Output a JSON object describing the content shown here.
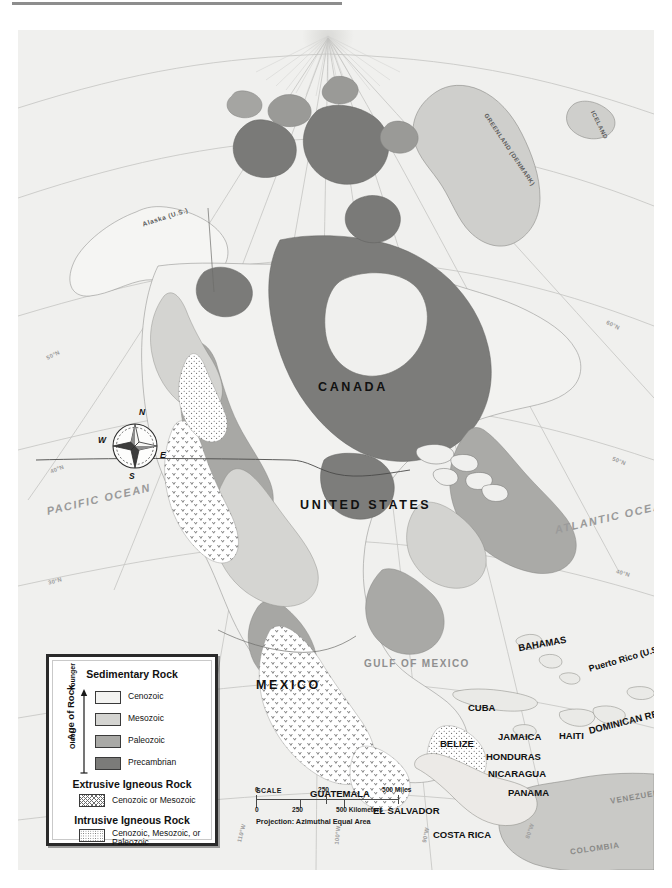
{
  "map": {
    "title": "Geologic Map of North America",
    "projection_note": "Projection: Azimuthal Equal Area",
    "background_color": "#f0f0ee",
    "countries": [
      {
        "name": "CANADA",
        "x": 318,
        "y": 356,
        "style": "big"
      },
      {
        "name": "UNITED STATES",
        "x": 300,
        "y": 474,
        "style": "big"
      },
      {
        "name": "MEXICO",
        "x": 255,
        "y": 655,
        "style": "big"
      },
      {
        "name": "BELIZE",
        "x": 440,
        "y": 714,
        "style": "sm"
      },
      {
        "name": "GUATEMALA",
        "x": 310,
        "y": 766,
        "style": "sm"
      },
      {
        "name": "EL SALVADOR",
        "x": 375,
        "y": 782,
        "style": "sm"
      },
      {
        "name": "HONDURAS",
        "x": 493,
        "y": 727,
        "style": "sm"
      },
      {
        "name": "NICARAGUA",
        "x": 497,
        "y": 744,
        "style": "sm"
      },
      {
        "name": "COSTA RICA",
        "x": 437,
        "y": 811,
        "style": "sm2"
      },
      {
        "name": "PANAMA",
        "x": 510,
        "y": 763,
        "style": "sm"
      },
      {
        "name": "CUBA",
        "x": 466,
        "y": 678,
        "style": "sm"
      },
      {
        "name": "JAMAICA",
        "x": 506,
        "y": 707,
        "style": "sm"
      },
      {
        "name": "HAITI",
        "x": 557,
        "y": 706,
        "style": "sm"
      },
      {
        "name": "BAHAMAS",
        "x": 524,
        "y": 616,
        "style": "sm"
      },
      {
        "name": "DOMINICAN REPUBLIC",
        "x": 588,
        "y": 697,
        "style": "sm"
      },
      {
        "name": "Puerto Rico (U.S.)",
        "x": 590,
        "y": 637,
        "style": "sm"
      }
    ],
    "regions": [
      {
        "name": "Alaska (U.S.)",
        "x": 139,
        "y": 192,
        "style": "isl"
      },
      {
        "name": "GREENLAND (DENMARK)",
        "x": 475,
        "y": 120,
        "style": "isl"
      },
      {
        "name": "ICELAND",
        "x": 582,
        "y": 101,
        "style": "isl"
      },
      {
        "name": "VENEZUELA",
        "x": 615,
        "y": 768,
        "style": "xs"
      },
      {
        "name": "COLOMBIA",
        "x": 575,
        "y": 819,
        "style": "xs"
      }
    ],
    "water_bodies": [
      {
        "name": "PACIFIC OCEAN",
        "x": 38,
        "y": 474,
        "style": "ocean"
      },
      {
        "name": "ATLANTIC OCEAN",
        "x": 556,
        "y": 494,
        "style": "ocean"
      },
      {
        "name": "GULF OF MEXICO",
        "x": 372,
        "y": 635,
        "style": "gulf"
      }
    ],
    "graticule": {
      "latitude_labels": [
        "50°N",
        "40°N",
        "30°N",
        "20°N",
        "10°N",
        "60°N"
      ],
      "longitude_labels": [
        "110°W",
        "100°W",
        "90°W",
        "80°W",
        "120°W",
        "70°W"
      ]
    }
  },
  "legend": {
    "sections": [
      {
        "heading": "Sedimentary Rock",
        "axis_label": "Age of Rock",
        "axis_top": "Younger",
        "axis_bottom": "Older",
        "items": [
          {
            "label": "Cenozoic",
            "color": "#f3f3f1",
            "pattern": "solid"
          },
          {
            "label": "Mesozoic",
            "color": "#d4d4d1",
            "pattern": "solid"
          },
          {
            "label": "Paleozoic",
            "color": "#a9a9a6",
            "pattern": "solid"
          },
          {
            "label": "Precambrian",
            "color": "#7b7b79",
            "pattern": "solid"
          }
        ]
      },
      {
        "heading": "Extrusive Igneous Rock",
        "items": [
          {
            "label": "Cenozoic or Mesozoic",
            "color": "#ffffff",
            "pattern": "v-stipple"
          }
        ]
      },
      {
        "heading": "Intrusive Igneous Rock",
        "items": [
          {
            "label": "Cenozoic, Mesozoic, or Paleozoic",
            "color": "#ffffff",
            "pattern": "dot-stipple"
          }
        ]
      }
    ]
  },
  "scale": {
    "title": "SCALE",
    "miles": {
      "ticks": [
        "0",
        "250",
        "500 Miles"
      ]
    },
    "kilometers": {
      "ticks": [
        "0",
        "250",
        "500 Kilometers"
      ]
    },
    "projection": "Projection: Azimuthal Equal Area"
  },
  "compass": {
    "north": "N",
    "south": "S",
    "east": "E",
    "west": "W"
  }
}
